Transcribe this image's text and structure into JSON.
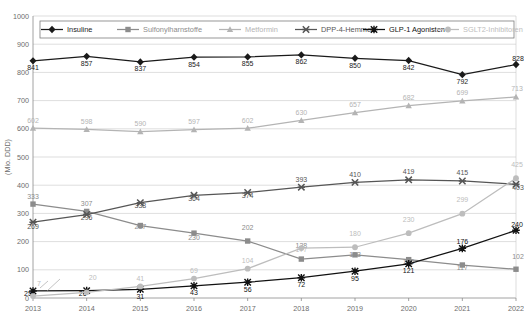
{
  "chart_data": {
    "type": "line",
    "title": "",
    "xlabel": "",
    "ylabel": "(Mio. DDD)",
    "categories": [
      "2013",
      "2014",
      "2015",
      "2016",
      "2017",
      "2018",
      "2019",
      "2020",
      "2021",
      "2022"
    ],
    "ylim": [
      0,
      1000
    ],
    "yticks": [
      "0",
      "100",
      "200",
      "300",
      "400",
      "500",
      "600",
      "700",
      "800",
      "900",
      "1000"
    ],
    "grid": true,
    "legend_position": "top-inside",
    "series": [
      {
        "name": "Insuline",
        "color": "#1a1a1a",
        "marker": "diamond",
        "values": [
          841,
          857,
          837,
          854,
          855,
          862,
          850,
          842,
          792,
          828
        ],
        "labels": [
          "841",
          "857",
          "837",
          "854",
          "855",
          "862",
          "850",
          "842",
          "792",
          "828"
        ]
      },
      {
        "name": "Sulfonylharnstoffe",
        "color": "#8c8c8c",
        "marker": "square",
        "values": [
          333,
          307,
          257,
          230,
          202,
          138,
          153,
          136,
          117,
          102
        ],
        "labels": [
          "333",
          "307",
          "257",
          "230",
          "202",
          "138",
          "153",
          "136",
          "117",
          "102"
        ]
      },
      {
        "name": "Metformin",
        "color": "#b4b4b4",
        "marker": "triangle",
        "values": [
          602,
          598,
          590,
          597,
          602,
          630,
          657,
          682,
          699,
          713
        ],
        "labels": [
          "602",
          "598",
          "590",
          "597",
          "602",
          "630",
          "657",
          "682",
          "699",
          "713"
        ]
      },
      {
        "name": "DPP-4-Hemmer",
        "color": "#565656",
        "marker": "cross",
        "values": [
          269,
          296,
          338,
          364,
          374,
          393,
          410,
          419,
          415,
          403
        ],
        "labels": [
          "269",
          "296",
          "338",
          "364",
          "374",
          "393",
          "410",
          "419",
          "415",
          "403"
        ]
      },
      {
        "name": "GLP-1 Agonisten",
        "color": "#111111",
        "marker": "star",
        "values": [
          25,
          26,
          31,
          43,
          56,
          72,
          95,
          121,
          176,
          240
        ],
        "labels": [
          "25",
          "26",
          "31",
          "43",
          "56",
          "72",
          "95",
          "121",
          "176",
          "240"
        ]
      },
      {
        "name": "SGLT2-Inhibitoren",
        "color": "#bdbdbd",
        "marker": "circle",
        "values": [
          7,
          20,
          41,
          69,
          104,
          177,
          180,
          230,
          299,
          425
        ],
        "labels": [
          "7",
          "20",
          "41",
          "69",
          "104",
          "177",
          "180",
          "230",
          "299",
          "425"
        ]
      }
    ]
  }
}
